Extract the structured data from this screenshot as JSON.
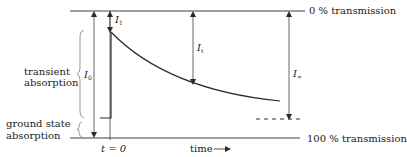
{
  "diagram": {
    "levels": {
      "top": "0 % transmission",
      "bottom": "100 % transmission"
    },
    "side_labels": {
      "transient_line1": "transient",
      "transient_line2": "absorption",
      "ground_line1": "ground state",
      "ground_line2": "absorption"
    },
    "quantities": {
      "I1": {
        "symbol": "I",
        "subscript": "1"
      },
      "I0": {
        "symbol": "I",
        "subscript": "0"
      },
      "It": {
        "symbol": "I",
        "subscript": "t"
      },
      "Iinf": {
        "symbol": "I",
        "subscript": "∞"
      }
    },
    "axis": {
      "t0_label": "t = 0",
      "time_label": "time",
      "time_arrow": "→"
    },
    "colors": {
      "line": "#2a2a2a",
      "background": "#ffffff"
    }
  }
}
